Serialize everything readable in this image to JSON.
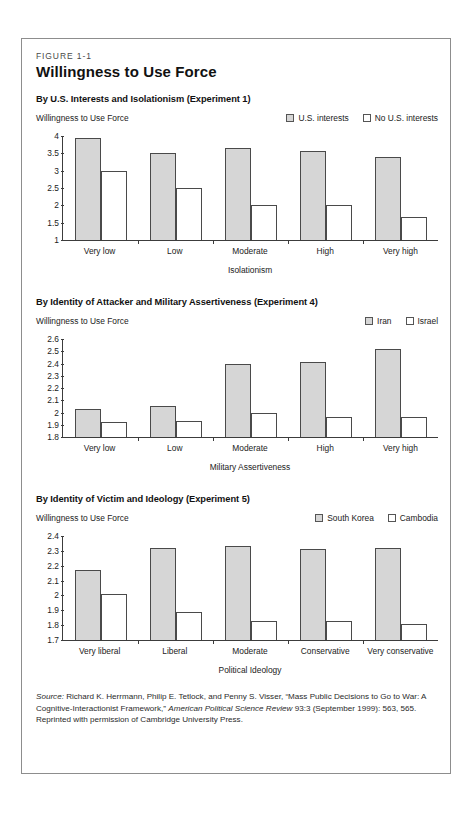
{
  "figure": {
    "number": "FIGURE 1-1",
    "title": "Willingness to Use Force"
  },
  "source": {
    "label": "Source:",
    "text_1": " Richard K. Herrmann, Philip E. Tetlock, and Penny S. Visser, “Mass Public Decisions to Go to War: A Cognitive-Interactionist Framework,” ",
    "journal": "American Political Science Review",
    "text_2": " 93:3 (September 1999): 563, 565. Reprinted with permission of Cambridge University Press."
  },
  "colors": {
    "series_a_fill": "#d6d6d6",
    "series_b_fill": "#ffffff",
    "outline": "#4a4a4a",
    "axis": "#3c3c3c",
    "frame": "#8d8d8d"
  },
  "chart_data": [
    {
      "type": "bar",
      "title": "By U.S. Interests and Isolationism (Experiment 1)",
      "ylabel": "Willingness to Use Force",
      "xlabel": "Isolationism",
      "categories": [
        "Very low",
        "Low",
        "Moderate",
        "High",
        "Very high"
      ],
      "series": [
        {
          "name": "U.S. interests",
          "values": [
            3.95,
            3.52,
            3.65,
            3.58,
            3.4
          ]
        },
        {
          "name": "No U.S. interests",
          "values": [
            3.0,
            2.5,
            2.0,
            2.0,
            1.65
          ]
        }
      ],
      "ylim": [
        1,
        4
      ],
      "yticks": [
        "4",
        "3.5",
        "3",
        "2.5",
        "2",
        "1.5",
        "1"
      ],
      "ytick_values": [
        4,
        3.5,
        3,
        2.5,
        2,
        1.5,
        1
      ],
      "grid": false,
      "legend_position": "top-right"
    },
    {
      "type": "bar",
      "title": "By Identity of Attacker and Military Assertiveness (Experiment 4)",
      "ylabel": "Willingness to Use Force",
      "xlabel": "Military Assertiveness",
      "categories": [
        "Very low",
        "Low",
        "Moderate",
        "High",
        "Very high"
      ],
      "series": [
        {
          "name": "Iran",
          "values": [
            2.03,
            2.05,
            2.4,
            2.41,
            2.52
          ]
        },
        {
          "name": "Israel",
          "values": [
            1.92,
            1.93,
            2.0,
            1.96,
            1.96
          ]
        }
      ],
      "ylim": [
        1.8,
        2.6
      ],
      "yticks": [
        "2.6",
        "2.5",
        "2.4",
        "2.3",
        "2.2",
        "2.1",
        "2",
        "1.9",
        "1.8"
      ],
      "ytick_values": [
        2.6,
        2.5,
        2.4,
        2.3,
        2.2,
        2.1,
        2,
        1.9,
        1.8
      ],
      "grid": false,
      "legend_position": "top-right"
    },
    {
      "type": "bar",
      "title": "By Identity of Victim and Ideology (Experiment 5)",
      "ylabel": "Willingness to Use Force",
      "xlabel": "Political Ideology",
      "categories": [
        "Very liberal",
        "Liberal",
        "Moderate",
        "Conservative",
        "Very conservative"
      ],
      "series": [
        {
          "name": "South Korea",
          "values": [
            2.17,
            2.32,
            2.33,
            2.31,
            2.32
          ]
        },
        {
          "name": "Cambodia",
          "values": [
            2.01,
            1.89,
            1.83,
            1.83,
            1.81
          ]
        }
      ],
      "ylim": [
        1.7,
        2.4
      ],
      "yticks": [
        "2.4",
        "2.3",
        "2.2",
        "2.1",
        "2",
        "1.9",
        "1.8",
        "1.7"
      ],
      "ytick_values": [
        2.4,
        2.3,
        2.2,
        2.1,
        2,
        1.9,
        1.8,
        1.7
      ],
      "grid": false,
      "legend_position": "top-right"
    }
  ]
}
